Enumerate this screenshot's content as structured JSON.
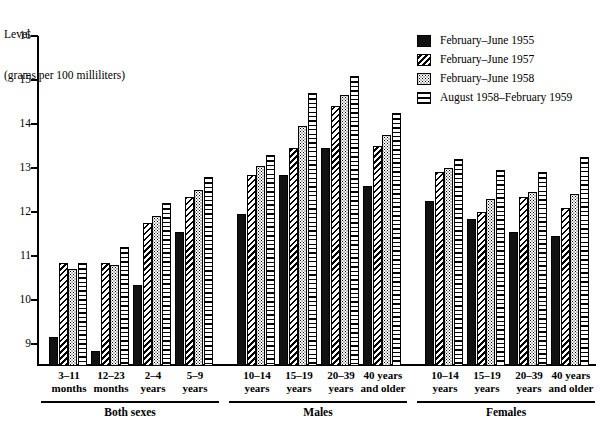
{
  "chart_data": {
    "type": "bar",
    "title": "",
    "ylabel_lines": [
      "Level",
      "(grams per 100 milliliters)"
    ],
    "xlabel": "",
    "ylim": [
      8.5,
      16
    ],
    "yticks": [
      9,
      10,
      11,
      12,
      13,
      14,
      15,
      16
    ],
    "ytick_labels": [
      "9",
      "10",
      "11",
      "12",
      "13",
      "14",
      "15",
      "16"
    ],
    "grid": false,
    "legend_position": "top-right",
    "legend": [
      {
        "name": "February–June 1955",
        "pattern": "solid-black"
      },
      {
        "name": "February–June 1957",
        "pattern": "diagonal-hatch"
      },
      {
        "name": "February–June 1958",
        "pattern": "stipple-dots"
      },
      {
        "name": "August 1958–February 1959",
        "pattern": "horizontal-lines"
      }
    ],
    "series": [
      {
        "name": "February–June 1955",
        "values": [
          9.15,
          8.85,
          10.35,
          11.55,
          11.95,
          12.85,
          13.45,
          12.6,
          12.25,
          11.85,
          11.55,
          11.45
        ]
      },
      {
        "name": "February–June 1957",
        "values": [
          10.85,
          10.85,
          11.75,
          12.35,
          12.85,
          13.45,
          14.4,
          13.5,
          12.9,
          12.0,
          12.35,
          12.1
        ]
      },
      {
        "name": "February–June 1958",
        "values": [
          10.7,
          10.8,
          11.9,
          12.5,
          13.05,
          13.95,
          14.65,
          13.75,
          13.0,
          12.3,
          12.45,
          12.4
        ]
      },
      {
        "name": "August 1958–February 1959",
        "values": [
          10.85,
          11.2,
          12.2,
          12.8,
          13.3,
          14.7,
          15.1,
          14.25,
          13.2,
          12.95,
          12.9,
          13.25
        ]
      }
    ],
    "categories": [
      "3–11 months",
      "12–23 months",
      "2–4 years",
      "5–9 years",
      "10–14 years",
      "15–19 years",
      "20–39 years",
      "40 years and older",
      "10–14 years",
      "15–19 years",
      "20–39 years",
      "40 years and older"
    ],
    "category_lines": [
      [
        "3–11",
        "months"
      ],
      [
        "12–23",
        "months"
      ],
      [
        "2–4",
        "years"
      ],
      [
        "5–9",
        "years"
      ],
      [
        "10–14",
        "years"
      ],
      [
        "15–19",
        "years"
      ],
      [
        "20–39",
        "years"
      ],
      [
        "40 years",
        "and older"
      ],
      [
        "10–14",
        "years"
      ],
      [
        "15–19",
        "years"
      ],
      [
        "20–39",
        "years"
      ],
      [
        "40 years",
        "and older"
      ]
    ],
    "sections": [
      {
        "label": "Both sexes",
        "start": 0,
        "count": 4
      },
      {
        "label": "Males",
        "start": 4,
        "count": 4
      },
      {
        "label": "Females",
        "start": 8,
        "count": 4
      }
    ],
    "colors": {
      "ink": "#000000",
      "background": "#ffffff",
      "series_fill_solid": "#111111"
    }
  }
}
